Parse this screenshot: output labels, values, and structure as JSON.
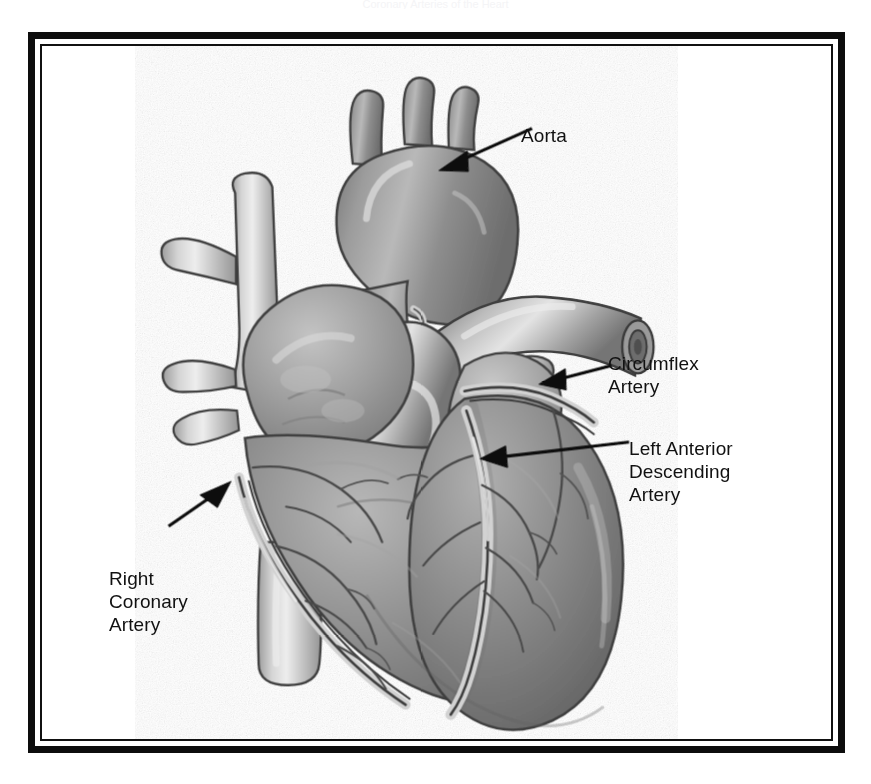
{
  "figure": {
    "domain_subject": "human heart coronary arteries",
    "caption_remnant": "Coronary Arteries of the Heart",
    "frame": {
      "outer_border_color": "#0d0d0d",
      "inner_border_color": "#111111",
      "background_color": "#ffffff"
    },
    "illustration": {
      "name": "anterior view of human heart with coronary circulation",
      "style": "grayscale halftone medical illustration",
      "palette": {
        "myocardium_mid": "#8f8f8f",
        "myocardium_dark": "#6b6b6b",
        "myocardium_light": "#b4b4b4",
        "vessel_light": "#c9c9c9",
        "vessel_highlight": "#ececec",
        "outline": "#3b3b3b",
        "artery_line": "#4a4a4a",
        "shadow": "#5a5a5a"
      },
      "structures": [
        "aortic arch",
        "brachiocephalic trunk",
        "left common carotid artery",
        "left subclavian artery",
        "superior vena cava",
        "pulmonary trunk",
        "right pulmonary artery",
        "pulmonary veins",
        "right atrium",
        "right ventricle",
        "left ventricle",
        "inferior vena cava",
        "right coronary artery",
        "left anterior descending artery",
        "circumflex artery"
      ]
    },
    "labels": [
      {
        "id": "aorta",
        "text": "Aorta",
        "lines": [
          "Aorta"
        ],
        "arrow": {
          "from_x": 513,
          "from_y": 110,
          "to_x": 432,
          "to_y": 135
        }
      },
      {
        "id": "circumflex",
        "text": "Circumflex\nArtery",
        "lines": [
          "Circumflex",
          "Artery"
        ],
        "arrow": {
          "from_x": 594,
          "from_y": 348,
          "to_x": 536,
          "to_y": 362
        }
      },
      {
        "id": "lad",
        "text": "Left Anterior\nDescending\nArtery",
        "lines": [
          "Left Anterior",
          "Descending",
          "Artery"
        ],
        "arrow": {
          "from_x": 612,
          "from_y": 426,
          "to_x": 474,
          "to_y": 441
        }
      },
      {
        "id": "rca",
        "text": "Right\nCoronary\nArtery",
        "lines": [
          "Right",
          "Coronary",
          "Artery"
        ],
        "arrow": {
          "from_x": 142,
          "from_y": 512,
          "to_x": 196,
          "to_y": 476
        }
      }
    ]
  }
}
